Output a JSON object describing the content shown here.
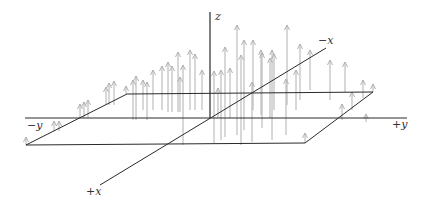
{
  "diagram": {
    "type": "3d-vector-field",
    "labels": {
      "z": "z",
      "neg_x": "−x",
      "pos_x": "+x",
      "neg_y": "−y",
      "pos_y": "+y"
    },
    "colors": {
      "axis": "#2a2a2a",
      "arrow": "#b0b0b0",
      "background": "#ffffff"
    },
    "geometry": {
      "origin": [
        210,
        118
      ],
      "z_axis": [
        [
          210,
          118
        ],
        [
          210,
          12
        ]
      ],
      "y_axis": [
        [
          25,
          118
        ],
        [
          407,
          118
        ]
      ],
      "x_axis": [
        [
          100,
          185
        ],
        [
          326,
          48
        ]
      ],
      "plane": [
        [
          127,
          94
        ],
        [
          373,
          92
        ],
        [
          305,
          143
        ],
        [
          26,
          145
        ]
      ]
    },
    "arrows": [
      [
        26,
        145,
        8
      ],
      [
        54,
        131,
        10
      ],
      [
        59,
        131,
        10
      ],
      [
        80,
        118,
        14
      ],
      [
        84,
        118,
        16
      ],
      [
        88,
        118,
        18
      ],
      [
        106,
        105,
        18
      ],
      [
        109,
        105,
        22
      ],
      [
        114,
        105,
        24
      ],
      [
        126,
        94,
        8
      ],
      [
        133,
        120,
        40
      ],
      [
        136,
        120,
        44
      ],
      [
        143,
        110,
        30
      ],
      [
        147,
        120,
        38
      ],
      [
        153,
        110,
        40
      ],
      [
        162,
        110,
        44
      ],
      [
        168,
        112,
        50
      ],
      [
        172,
        112,
        46
      ],
      [
        178,
        112,
        60
      ],
      [
        180,
        112,
        35
      ],
      [
        190,
        110,
        60
      ],
      [
        195,
        110,
        56
      ],
      [
        202,
        110,
        40
      ],
      [
        183,
        145,
        80
      ],
      [
        214,
        143,
        72
      ],
      [
        225,
        137,
        90
      ],
      [
        237,
        135,
        110
      ],
      [
        244,
        130,
        90
      ],
      [
        218,
        118,
        30
      ],
      [
        221,
        140,
        70
      ],
      [
        230,
        118,
        50
      ],
      [
        262,
        128,
        75
      ],
      [
        270,
        118,
        60
      ],
      [
        253,
        110,
        70
      ],
      [
        261,
        115,
        65
      ],
      [
        274,
        110,
        56
      ],
      [
        287,
        105,
        80
      ],
      [
        300,
        100,
        56
      ],
      [
        241,
        145,
        90
      ],
      [
        252,
        142,
        60
      ],
      [
        272,
        140,
        90
      ],
      [
        286,
        135,
        56
      ],
      [
        310,
        90,
        40
      ],
      [
        330,
        100,
        40
      ],
      [
        345,
        92,
        30
      ],
      [
        363,
        98,
        18
      ],
      [
        296,
        110,
        40
      ],
      [
        342,
        120,
        16
      ],
      [
        352,
        110,
        18
      ],
      [
        373,
        92,
        8
      ],
      [
        366,
        122,
        8
      ],
      [
        305,
        143,
        10
      ]
    ]
  }
}
